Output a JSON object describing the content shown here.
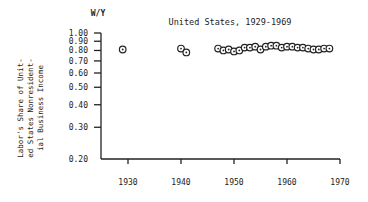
{
  "chart_data": {
    "type": "scatter",
    "title": "United States, 1929-1969",
    "ylabel_top": "W/Y",
    "ylabel_lines": [
      "Labor's Share of Unit-",
      "ed States Nonresident-",
      "ial Business Income"
    ],
    "xlabel": "",
    "yscale": "log",
    "ylim": [
      0.2,
      1.0
    ],
    "xlim": [
      1925,
      1970
    ],
    "yticks": [
      1.0,
      0.9,
      0.8,
      0.7,
      0.6,
      0.5,
      0.4,
      0.3,
      0.2
    ],
    "ytick_labels": [
      "1.00",
      "0.90",
      "0.80",
      "0.70",
      "0.60",
      "0.50",
      "0.40",
      "0.30",
      "0.20"
    ],
    "xticks": [
      1930,
      1940,
      1950,
      1960,
      1970
    ],
    "xtick_labels": [
      "1930",
      "1940",
      "1950",
      "1960",
      "1970"
    ],
    "grid": false,
    "marker": "open-circle-with-dot",
    "x": [
      1929,
      1940,
      1941,
      1947,
      1948,
      1949,
      1950,
      1951,
      1952,
      1953,
      1954,
      1955,
      1956,
      1957,
      1958,
      1959,
      1960,
      1961,
      1962,
      1963,
      1964,
      1965,
      1966,
      1967,
      1968
    ],
    "y": [
      0.81,
      0.82,
      0.78,
      0.82,
      0.8,
      0.81,
      0.79,
      0.8,
      0.83,
      0.83,
      0.84,
      0.81,
      0.84,
      0.85,
      0.85,
      0.83,
      0.84,
      0.84,
      0.83,
      0.83,
      0.82,
      0.81,
      0.81,
      0.82,
      0.82
    ]
  }
}
